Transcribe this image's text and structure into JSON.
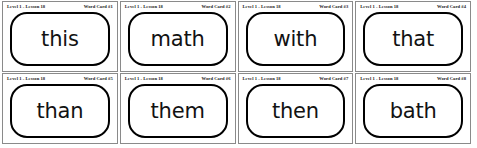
{
  "document": {
    "title": "Word Cards Worksheet",
    "background_color": "#ffffff",
    "card_border_color": "#8a8a8a",
    "frame_border_color": "#000000",
    "text_color": "#121212",
    "layout": {
      "columns": 4,
      "rows": 2,
      "total_cards": 8
    }
  },
  "cards": [
    {
      "lesson": "Level 1 - Lesson 18",
      "card_number": "Word Card #1",
      "word": "this"
    },
    {
      "lesson": "Level 1 - Lesson 18",
      "card_number": "Word Card #2",
      "word": "math"
    },
    {
      "lesson": "Level 1 - Lesson 18",
      "card_number": "Word Card #3",
      "word": "with"
    },
    {
      "lesson": "Level 1 - Lesson 18",
      "card_number": "Word Card #4",
      "word": "that"
    },
    {
      "lesson": "Level 1 - Lesson 18",
      "card_number": "Word Card #5",
      "word": "than"
    },
    {
      "lesson": "Level 1 - Lesson 18",
      "card_number": "Word Card #6",
      "word": "them"
    },
    {
      "lesson": "Level 1 - Lesson 18",
      "card_number": "Word Card #7",
      "word": "then"
    },
    {
      "lesson": "Level 1 - Lesson 18",
      "card_number": "Word Card #8",
      "word": "bath"
    }
  ]
}
